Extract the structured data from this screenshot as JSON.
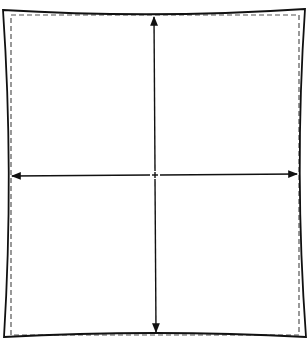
{
  "diagram": {
    "type": "pincushion-distortion-illustration",
    "colors": {
      "background": "#ffffff",
      "stroke": "#111111",
      "dashed": "#555555"
    },
    "outer_shape": {
      "style": "solid",
      "description": "square with inward-curved (concave) edges",
      "corners": [
        [
          3,
          10
        ],
        [
          305,
          9
        ],
        [
          306,
          337
        ],
        [
          4,
          337
        ]
      ],
      "edge_midpoints": {
        "top": [
          154,
          15
        ],
        "right": [
          297,
          175
        ],
        "bottom": [
          155,
          333
        ],
        "left": [
          10,
          175
        ]
      }
    },
    "inner_reference": {
      "style": "dashed",
      "rect": {
        "x": 11,
        "y": 15,
        "width": 288,
        "height": 320
      }
    },
    "arrows": [
      {
        "name": "vertical",
        "from": [
          154,
          16
        ],
        "to": [
          156,
          333
        ],
        "heads": "both"
      },
      {
        "name": "horizontal",
        "from": [
          11,
          175
        ],
        "to": [
          298,
          174
        ],
        "heads": "both"
      }
    ],
    "center_marker": {
      "x": 155,
      "y": 175
    }
  }
}
